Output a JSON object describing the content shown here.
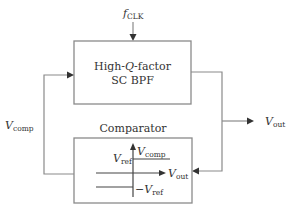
{
  "diagram": {
    "type": "block-diagram",
    "colors": {
      "box_stroke": "#8a8a8a",
      "wire_stroke": "#8a8a8a",
      "axis_stroke": "#444444",
      "text": "#333333",
      "background": "#ffffff"
    },
    "clock_input": {
      "symbol": "f",
      "subscript": "CLK"
    },
    "filter_block": {
      "line1": "High-Q-factor",
      "line1_pre": "High-",
      "line1_q": "Q",
      "line1_post": "-factor",
      "line2": "SC BPF"
    },
    "comparator_block": {
      "title": "Comparator",
      "transfer_plot": {
        "y_axis": {
          "symbol": "V",
          "subscript": "comp"
        },
        "x_axis": {
          "symbol": "V",
          "subscript": "out"
        },
        "upper_level": {
          "symbol": "V",
          "subscript": "ref"
        },
        "lower_level": {
          "symbol": "−V",
          "subscript": "ref"
        }
      }
    },
    "signals": {
      "feedback": {
        "symbol": "V",
        "subscript": "comp"
      },
      "output": {
        "symbol": "V",
        "subscript": "out"
      }
    },
    "connections": [
      {
        "from": "clock_input",
        "to": "filter_block"
      },
      {
        "from": "filter_block",
        "to": "output"
      },
      {
        "from": "filter_block",
        "to": "comparator_block"
      },
      {
        "from": "comparator_block",
        "to": "filter_block",
        "label": "Vcomp"
      }
    ]
  }
}
